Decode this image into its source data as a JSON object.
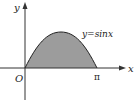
{
  "diagram": {
    "curve_label_prefix": "y=sin",
    "curve_label_var": "x",
    "x_axis_label": "x",
    "y_axis_label": "y",
    "origin_label": "O",
    "pi_label": "π",
    "fill_color": "#9c9c9c",
    "stroke_color": "#222222"
  }
}
